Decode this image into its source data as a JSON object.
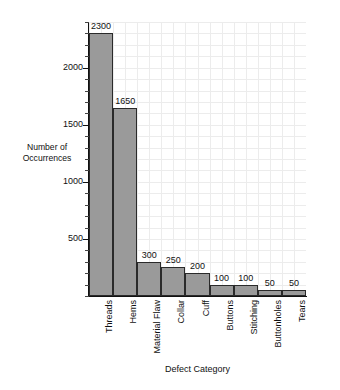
{
  "chart_data": {
    "type": "bar",
    "title": "",
    "subtitle": "",
    "xlabel": "Defect Category",
    "ylabel": "Number of Occurrences",
    "ylabel_lines": [
      "Number of",
      "Occurrences"
    ],
    "categories": [
      "Threads",
      "Hems",
      "Material Flaw",
      "Collar",
      "Cuff",
      "Buttons",
      "Stitching",
      "Buttonholes",
      "Tears"
    ],
    "values": [
      2300,
      1650,
      300,
      250,
      200,
      100,
      100,
      50,
      50
    ],
    "value_labels": [
      "2300",
      "1650",
      "300",
      "250",
      "200",
      "100",
      "100",
      "50",
      "50"
    ],
    "ylim": [
      0,
      2400
    ],
    "xlim_note": "9 adjacent categorical bars, no gaps",
    "y_major_ticks": [
      500,
      1000,
      1500,
      2000
    ],
    "y_major_tick_labels": [
      "500",
      "1000",
      "1500",
      "2000"
    ],
    "y_minor_tick_interval": 100,
    "grid": true,
    "grid_color": "#ececec",
    "legend": null,
    "bar_fill_color": "#9a9a9a",
    "bar_edge_color": "#2a2a2a",
    "axis_color": "#111111",
    "background_color": "#ffffff",
    "category_label_rotation": 90
  }
}
